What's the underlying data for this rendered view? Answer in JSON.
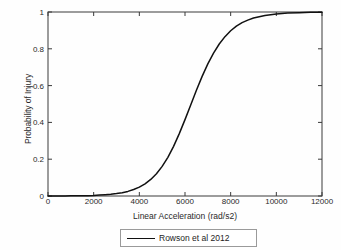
{
  "chart_data": {
    "type": "line",
    "title": "",
    "xlabel": "Linear Acceleration (rad/s2)",
    "ylabel": "Probability of Injury",
    "xlim": [
      0,
      12000
    ],
    "ylim": [
      0,
      1
    ],
    "grid": false,
    "legend_position": "below-center",
    "xticks": [
      0,
      2000,
      4000,
      6000,
      8000,
      10000,
      12000
    ],
    "xticklabels": [
      "0",
      "2000",
      "4000",
      "6000",
      "8000",
      "10000",
      "12000"
    ],
    "yticks": [
      0,
      0.2,
      0.4,
      0.6,
      0.8,
      1
    ],
    "yticklabels": [
      "0",
      "0.2",
      "0.4",
      "0.6",
      "0.8",
      "1"
    ],
    "series": [
      {
        "name": "Rowson et al 2012",
        "color": "#111111",
        "linewidth": 1.5,
        "x": [
          0,
          250,
          500,
          750,
          1000,
          1250,
          1500,
          1750,
          2000,
          2250,
          2500,
          2750,
          3000,
          3250,
          3500,
          3750,
          4000,
          4250,
          4500,
          4750,
          5000,
          5250,
          5500,
          5750,
          6000,
          6250,
          6500,
          6750,
          7000,
          7250,
          7500,
          7750,
          8000,
          8250,
          8500,
          8750,
          9000,
          9500,
          10000,
          10500,
          11000,
          11500,
          12000
        ],
        "y": [
          0.0,
          0.0,
          0.0,
          0.0,
          0.001,
          0.001,
          0.002,
          0.002,
          0.003,
          0.005,
          0.007,
          0.009,
          0.013,
          0.018,
          0.025,
          0.035,
          0.048,
          0.066,
          0.09,
          0.121,
          0.161,
          0.21,
          0.27,
          0.339,
          0.415,
          0.495,
          0.575,
          0.65,
          0.718,
          0.777,
          0.826,
          0.866,
          0.898,
          0.923,
          0.942,
          0.956,
          0.967,
          0.981,
          0.989,
          0.994,
          0.996,
          0.998,
          0.999
        ]
      }
    ]
  },
  "legend": {
    "entries": [
      {
        "label": "Rowson et al 2012",
        "color": "#111111"
      }
    ]
  },
  "axes": {
    "xlabel": "Linear Acceleration (rad/s2)",
    "ylabel": "Probability of Injury"
  }
}
